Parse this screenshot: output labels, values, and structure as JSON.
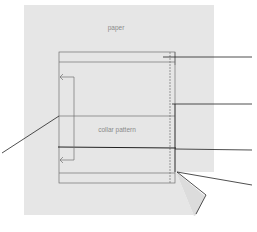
{
  "diagram": {
    "title": "",
    "colors": {
      "background": "#ffffff",
      "paper": "#e6e6e6",
      "fold": "#d9d9d9",
      "line": "#707070",
      "leader": "#222222",
      "text": "#8a8a8a"
    },
    "labels": {
      "paper": "paper",
      "collar_pattern": "collar pattern"
    },
    "elements": [
      {
        "id": "paper",
        "type": "sheet",
        "label": "paper"
      },
      {
        "id": "collar-pattern",
        "type": "rectangle-outline",
        "label": "collar pattern"
      },
      {
        "id": "fold-arrow",
        "type": "bracket-arrow",
        "direction": "both-ends-left"
      },
      {
        "id": "folded-corner",
        "type": "torn/folded paper corner"
      }
    ],
    "leader_lines": [
      {
        "id": "leader-top-right",
        "from": "top band of pattern",
        "to": "right margin",
        "label": ""
      },
      {
        "id": "leader-mid-right",
        "from": "right seam edge",
        "to": "right margin",
        "label": ""
      },
      {
        "id": "leader-left",
        "from": "left edge at middle line",
        "to": "left margin",
        "label": ""
      },
      {
        "id": "leader-center-right",
        "from": "bold center line",
        "to": "right margin",
        "label": ""
      },
      {
        "id": "leader-bottom-right",
        "from": "folded corner",
        "to": "right margin",
        "label": ""
      }
    ]
  }
}
